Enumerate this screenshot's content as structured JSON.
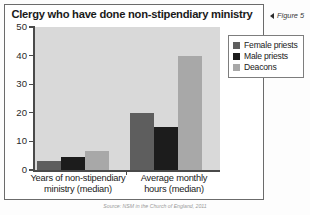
{
  "figure": {
    "caption_marker": "figure-arrow-icon",
    "caption_text": "Figure 5",
    "source_note": "Source: NSM in the Church of England, 2011"
  },
  "chart_data": {
    "type": "bar",
    "title": "Clergy who have done non-stipendiary ministry",
    "xlabel": "",
    "ylabel": "",
    "ylim": [
      0,
      50
    ],
    "yticks": [
      0,
      10,
      20,
      30,
      40,
      50
    ],
    "ytick_labels": [
      "0",
      "10",
      "20",
      "30",
      "40",
      "50"
    ],
    "grid": false,
    "legend_position": "right",
    "categories": [
      "Years of non-stipendiary ministry (median)",
      "Average monthly hours (median)"
    ],
    "category_lines": [
      [
        "Years of non-stipendiary",
        "ministry (median)"
      ],
      [
        "Average monthly",
        "hours (median)"
      ]
    ],
    "series": [
      {
        "name": "Female priests",
        "color": "#5e5e5e",
        "values": [
          3,
          20
        ]
      },
      {
        "name": "Male priests",
        "color": "#1c1c1c",
        "values": [
          4.5,
          15
        ]
      },
      {
        "name": "Deacons",
        "color": "#a8a8a8",
        "values": [
          6.5,
          40
        ]
      }
    ],
    "plot_background": "#d9d9d9",
    "axis_color": "#4a4a4a"
  }
}
